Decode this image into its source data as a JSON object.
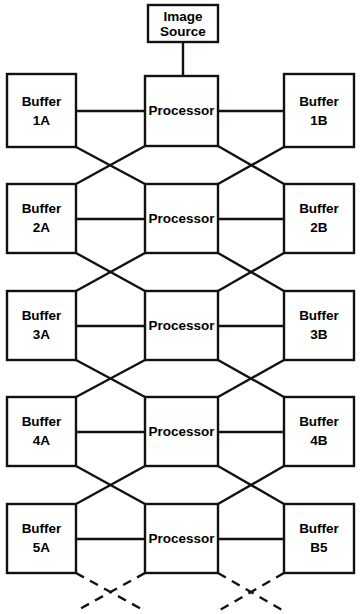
{
  "figure": {
    "background_color": "#ffffff",
    "line_color": "#111111",
    "box_fill": "#ffffff",
    "width": 361,
    "height": 614
  },
  "source": {
    "label_line1": "Image",
    "label_line2": "Source"
  },
  "stages": [
    {
      "buffer_left_line1": "Buffer",
      "buffer_left_line2": "1A",
      "processor_label": "Processor",
      "buffer_right_line1": "Buffer",
      "buffer_right_line2": "1B"
    },
    {
      "buffer_left_line1": "Buffer",
      "buffer_left_line2": "2A",
      "processor_label": "Processor",
      "buffer_right_line1": "Buffer",
      "buffer_right_line2": "2B"
    },
    {
      "buffer_left_line1": "Buffer",
      "buffer_left_line2": "3A",
      "processor_label": "Processor",
      "buffer_right_line1": "Buffer",
      "buffer_right_line2": "3B"
    },
    {
      "buffer_left_line1": "Buffer",
      "buffer_left_line2": "4A",
      "processor_label": "Processor",
      "buffer_right_line1": "Buffer",
      "buffer_right_line2": "4B"
    },
    {
      "buffer_left_line1": "Buffer",
      "buffer_left_line2": "5A",
      "processor_label": "Processor",
      "buffer_right_line1": "Buffer",
      "buffer_right_line2": "B5"
    }
  ],
  "continuation": {
    "style": "dashed",
    "description": "dashed crossover lines indicating the pipeline continues"
  }
}
